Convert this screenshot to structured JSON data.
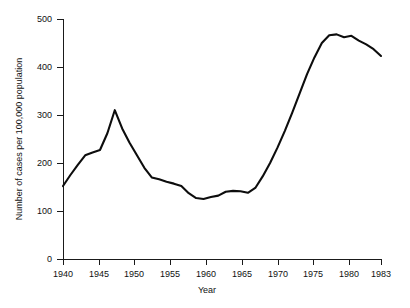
{
  "chart_data": {
    "type": "line",
    "title": "",
    "xlabel": "Year",
    "ylabel": "Number of cases per 100,000 population",
    "xlim": [
      1940,
      1983
    ],
    "ylim": [
      0,
      500
    ],
    "grid": false,
    "legend": false,
    "xticks": [
      1940,
      1945,
      1950,
      1955,
      1960,
      1965,
      1970,
      1975,
      1980,
      1983
    ],
    "xtick_labels": [
      "1940",
      "1945",
      "1950",
      "1955",
      "1960",
      "1965",
      "1970",
      "1975",
      "1980",
      "1983"
    ],
    "yticks": [
      0,
      100,
      200,
      300,
      400,
      500
    ],
    "ytick_labels": [
      "0",
      "100",
      "200",
      "300",
      "400",
      "500"
    ],
    "x": [
      1940,
      1941,
      1942,
      1943,
      1944,
      1945,
      1946,
      1947,
      1948,
      1949,
      1950,
      1951,
      1952,
      1953,
      1954,
      1955,
      1956,
      1957,
      1958,
      1959,
      1960,
      1961,
      1962,
      1963,
      1964,
      1965,
      1966,
      1967,
      1968,
      1969,
      1970,
      1971,
      1972,
      1973,
      1974,
      1975,
      1976,
      1977,
      1978,
      1979,
      1980,
      1981,
      1982,
      1983
    ],
    "values": [
      152,
      175,
      196,
      216,
      222,
      227,
      262,
      310,
      272,
      242,
      216,
      190,
      170,
      166,
      161,
      157,
      152,
      137,
      127,
      125,
      129,
      132,
      140,
      142,
      141,
      138,
      148,
      172,
      200,
      232,
      267,
      305,
      345,
      385,
      420,
      450,
      466,
      468,
      462,
      465,
      455,
      447,
      437,
      423
    ],
    "series_color": "#0d0d0d"
  }
}
